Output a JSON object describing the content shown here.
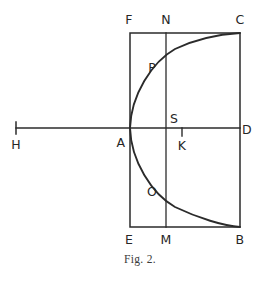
{
  "figure": {
    "caption": "Fig. 2.",
    "ink_color": "#2b2b2b",
    "background_color": "#ffffff",
    "width": 264,
    "height": 281,
    "labels": [
      {
        "key": "F",
        "text": "F",
        "x": 129,
        "y": 20
      },
      {
        "key": "N",
        "text": "N",
        "x": 166,
        "y": 20
      },
      {
        "key": "C",
        "text": "C",
        "x": 240,
        "y": 20
      },
      {
        "key": "P",
        "text": "P",
        "x": 152,
        "y": 68
      },
      {
        "key": "S",
        "text": "S",
        "x": 174,
        "y": 119
      },
      {
        "key": "H",
        "text": "H",
        "x": 16,
        "y": 145
      },
      {
        "key": "A",
        "text": "A",
        "x": 121,
        "y": 143
      },
      {
        "key": "K",
        "text": "K",
        "x": 182,
        "y": 146
      },
      {
        "key": "D",
        "text": "D",
        "x": 247,
        "y": 130
      },
      {
        "key": "O",
        "text": "O",
        "x": 152,
        "y": 192
      },
      {
        "key": "E",
        "text": "E",
        "x": 129,
        "y": 240
      },
      {
        "key": "M",
        "text": "M",
        "x": 166,
        "y": 240
      },
      {
        "key": "B",
        "text": "B",
        "x": 240,
        "y": 240
      }
    ],
    "caption_position": {
      "x": 140,
      "y": 259
    },
    "geometry": {
      "rect": {
        "left": 130,
        "top": 33,
        "right": 240,
        "bottom": 227
      },
      "axis_line": {
        "x1": 16,
        "y1": 128,
        "x2": 240,
        "y2": 128
      },
      "h_tick": {
        "x": 16,
        "y1": 122,
        "y2": 134
      },
      "k_tick": {
        "x": 182,
        "y1": 128,
        "y2": 136
      },
      "vertical_nm": {
        "x": 166,
        "y1": 33,
        "y2": 227
      },
      "curve_upper": "M 130 128 C 131 95, 152 62, 175 49 C 198 38, 224 34, 240 33",
      "curve_lower": "M 130 128 C 131 161, 152 194, 175 207 C 198 218, 224 226, 240 227",
      "vertex": {
        "x": 130,
        "y": 128
      },
      "point_p": {
        "x": 166,
        "y": 75
      },
      "point_o": {
        "x": 166,
        "y": 181
      }
    }
  }
}
